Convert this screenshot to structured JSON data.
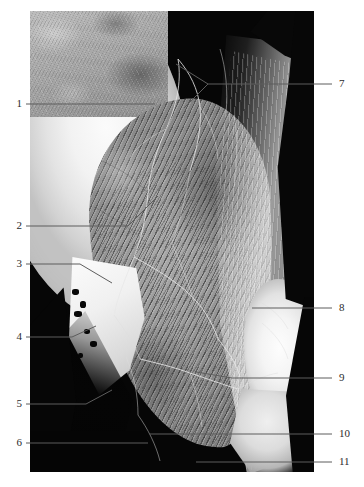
{
  "figure": {
    "kind": "anatomical-dissection-photograph",
    "region": "gluteal region and posterior thigh",
    "rendering": "black-and-white photograph",
    "photo_frame": {
      "x": 30,
      "y": 11,
      "width": 284,
      "height": 461
    },
    "background_color": "#ffffff",
    "plate_color": "#060606",
    "leader_color": "#5d5d5d",
    "label_color": "#2b2b2b"
  },
  "labels": {
    "left": [
      {
        "number": "1",
        "x": 16,
        "y": 104,
        "line_to_x": 155,
        "line_to_y": 104
      },
      {
        "number": "2",
        "x": 16,
        "y": 226,
        "line_to_x": 158,
        "line_to_y": 196
      },
      {
        "number": "3",
        "x": 16,
        "y": 264,
        "line_to_x": 112,
        "line_to_y": 264
      },
      {
        "number": "4",
        "x": 16,
        "y": 337,
        "line_to_x": 90,
        "line_to_y": 331
      },
      {
        "number": "5",
        "x": 16,
        "y": 404,
        "line_to_x": 112,
        "line_to_y": 392
      },
      {
        "number": "6",
        "x": 16,
        "y": 443,
        "line_to_x": 148,
        "line_to_y": 443
      }
    ],
    "right": [
      {
        "number": "7",
        "x": 340,
        "y": 84,
        "line_to_x": 178,
        "line_to_y": 66
      },
      {
        "number": "8",
        "x": 340,
        "y": 308,
        "line_to_x": 252,
        "line_to_y": 308
      },
      {
        "number": "9",
        "x": 340,
        "y": 378,
        "line_to_x": 196,
        "line_to_y": 378
      },
      {
        "number": "10",
        "x": 340,
        "y": 434,
        "line_to_x": 150,
        "line_to_y": 434
      },
      {
        "number": "11",
        "x": 340,
        "y": 462,
        "line_to_x": 195,
        "line_to_y": 462
      }
    ]
  },
  "structures": [
    {
      "id": "upper-left-field",
      "name": "skin and subcutaneous fascia field"
    },
    {
      "id": "iliac-crest-sheet",
      "name": "pale fascial sheet over iliac crest"
    },
    {
      "id": "gluteus-maximus",
      "name": "striated gluteal muscle belly"
    },
    {
      "id": "iliotibial-tract",
      "name": "bright fascial tract band"
    },
    {
      "id": "greater-trochanter",
      "name": "bright trochanteric prominence"
    },
    {
      "id": "bone-fragment",
      "name": "bone fragment with dark foramina"
    },
    {
      "id": "nerve-network",
      "name": "pale cutaneous nerve and vessel filaments"
    }
  ]
}
